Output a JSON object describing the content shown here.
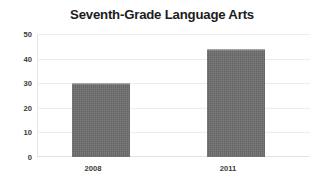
{
  "chart_data": {
    "type": "bar",
    "title": "Seventh-Grade Language Arts",
    "categories": [
      "2008",
      "2011"
    ],
    "values": [
      30,
      44
    ],
    "series": [
      {
        "name": "Seventh-Grade Language Arts",
        "values": [
          30,
          44
        ]
      }
    ],
    "xlabel": "",
    "ylabel": "",
    "ylim": [
      0,
      50
    ],
    "yticks": [
      0,
      10,
      20,
      30,
      40,
      50
    ],
    "ytick_labels": [
      "0",
      "10",
      "20",
      "30",
      "40",
      "50"
    ],
    "grid": true,
    "grid_axis": "y",
    "legend": false,
    "legend_position": "none",
    "bar_color": "#6e6e6e",
    "grid_color": "#ededf0",
    "background_color": "#ffffff",
    "title_color": "#1c1c1c",
    "tick_label_color": "#3a3a3a"
  }
}
